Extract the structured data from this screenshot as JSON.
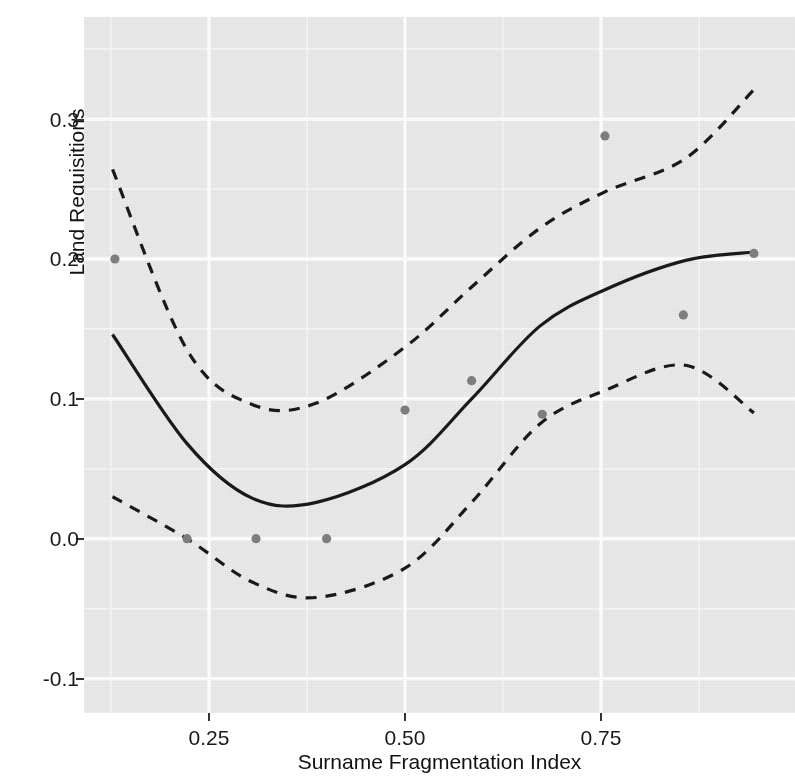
{
  "chart_data": {
    "type": "line",
    "title": "",
    "xlabel": "Surname Fragmentation Index",
    "ylabel": "Land Requisitions",
    "xlim": [
      0.0906,
      0.9974
    ],
    "ylim": [
      -0.1246,
      0.373
    ],
    "xticks": [
      0.25,
      0.5,
      0.75
    ],
    "xticklabels": [
      "0.25",
      "0.50",
      "0.75"
    ],
    "yticks": [
      -0.1,
      0.0,
      0.1,
      0.2,
      0.3
    ],
    "yticklabels": [
      "-0.1",
      "0.0",
      "0.1",
      "0.2",
      "0.3"
    ],
    "grid": true,
    "grid_major_color": "#ffffff",
    "grid_minor_color": "#f7f7f7",
    "panel_background": "#ebebeb",
    "legend": "none",
    "series": [
      {
        "name": "fit",
        "style": "solid",
        "color": "#1a1a1a",
        "x": [
          0.127,
          0.222,
          0.305,
          0.387,
          0.5,
          0.585,
          0.672,
          0.755,
          0.858,
          0.945
        ],
        "values": [
          0.146,
          0.068,
          0.029,
          0.026,
          0.053,
          0.1,
          0.152,
          0.178,
          0.199,
          0.205
        ]
      },
      {
        "name": "upper-confidence-band",
        "style": "dashed",
        "color": "#1a1a1a",
        "x": [
          0.127,
          0.222,
          0.305,
          0.387,
          0.5,
          0.585,
          0.672,
          0.755,
          0.858,
          0.945
        ],
        "values": [
          0.264,
          0.135,
          0.096,
          0.097,
          0.137,
          0.18,
          0.222,
          0.248,
          0.272,
          0.321
        ]
      },
      {
        "name": "lower-confidence-band",
        "style": "dashed",
        "color": "#1a1a1a",
        "x": [
          0.127,
          0.222,
          0.305,
          0.387,
          0.5,
          0.585,
          0.672,
          0.755,
          0.858,
          0.945
        ],
        "values": [
          0.03,
          0.0,
          -0.031,
          -0.042,
          -0.021,
          0.026,
          0.082,
          0.106,
          0.124,
          0.09
        ]
      },
      {
        "name": "observations",
        "style": "points",
        "color": "#7f7f7f",
        "x": [
          0.13,
          0.222,
          0.31,
          0.4,
          0.5,
          0.585,
          0.675,
          0.755,
          0.855,
          0.945
        ],
        "values": [
          0.2,
          0.0,
          0.0,
          0.0,
          0.092,
          0.113,
          0.089,
          0.288,
          0.16,
          0.204
        ]
      }
    ]
  },
  "axes": {
    "x_title": "Surname Fragmentation Index",
    "y_title": "Land Requisitions",
    "x_tick_labels": [
      "0.25",
      "0.50",
      "0.75"
    ],
    "y_tick_labels": [
      "0.3",
      "0.2",
      "0.1",
      "0.0",
      "-0.1"
    ]
  }
}
